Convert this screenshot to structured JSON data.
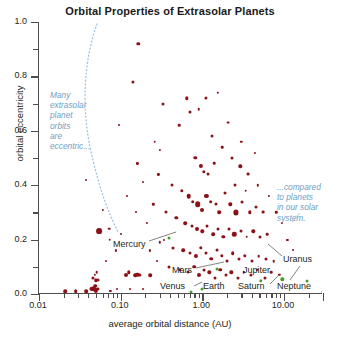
{
  "chart_data": {
    "type": "scatter",
    "title": "Orbital Properties of Extrasolar Planets",
    "xlabel": "average orbital distance (AU)",
    "ylabel": "orbital eccentricity",
    "xscale": "log",
    "xlim": [
      0.01,
      30.0
    ],
    "ylim": [
      0.0,
      1.0
    ],
    "grid": false,
    "legend": "none",
    "xticklabels": [
      "0.01",
      "0.10",
      "1.00",
      "10.00"
    ],
    "xtickvalues": [
      0.01,
      0.1,
      1.0,
      10.0
    ],
    "yticklabels": [
      "0.0",
      "0.2",
      "0.4",
      "0.6",
      "0.8",
      "1.0"
    ],
    "ytickvalues": [
      0.0,
      0.2,
      0.4,
      0.6,
      0.8,
      1.0
    ],
    "series": [
      {
        "name": "extrasolar planets",
        "color": "#8c1117",
        "points": [
          [
            0.021,
            0.01,
            3.6
          ],
          [
            0.028,
            0.01,
            3.6
          ],
          [
            0.038,
            0.01,
            3.6
          ],
          [
            0.043,
            0.02,
            3.0
          ],
          [
            0.045,
            0.02,
            4.6
          ],
          [
            0.047,
            0.02,
            5.4
          ],
          [
            0.049,
            0.03,
            3.6
          ],
          [
            0.05,
            0.01,
            4.2
          ],
          [
            0.052,
            0.02,
            3.2
          ],
          [
            0.046,
            0.06,
            3.2
          ],
          [
            0.048,
            0.07,
            2.4
          ],
          [
            0.05,
            0.05,
            3.4
          ],
          [
            0.053,
            0.05,
            3.0
          ],
          [
            0.051,
            0.08,
            2.6
          ],
          [
            0.075,
            0.01,
            2.2
          ],
          [
            0.09,
            0.02,
            2.0
          ],
          [
            0.115,
            0.07,
            4.0
          ],
          [
            0.125,
            0.08,
            3.4
          ],
          [
            0.15,
            0.07,
            3.6
          ],
          [
            0.16,
            0.07,
            4.4
          ],
          [
            0.172,
            0.07,
            3.2
          ],
          [
            0.23,
            0.07,
            3.6
          ],
          [
            0.13,
            0.02,
            2.0
          ],
          [
            0.19,
            0.02,
            2.0
          ],
          [
            0.055,
            0.23,
            5.8
          ],
          [
            0.072,
            0.24,
            2.6
          ],
          [
            0.073,
            0.2,
            2.6
          ],
          [
            0.06,
            0.31,
            2.2
          ],
          [
            0.038,
            0.42,
            2.0
          ],
          [
            0.165,
            0.92,
            3.4
          ],
          [
            0.14,
            0.78,
            3.2
          ],
          [
            0.095,
            0.62,
            2.0
          ],
          [
            0.26,
            0.56,
            2.6
          ],
          [
            0.3,
            0.53,
            2.2
          ],
          [
            0.33,
            0.7,
            3.0
          ],
          [
            0.52,
            0.62,
            2.6
          ],
          [
            0.64,
            0.72,
            3.4
          ],
          [
            0.7,
            0.67,
            3.0
          ],
          [
            0.9,
            0.68,
            2.6
          ],
          [
            1.1,
            0.72,
            3.2
          ],
          [
            1.55,
            0.74,
            2.4
          ],
          [
            2.05,
            0.63,
            2.8
          ],
          [
            1.3,
            0.58,
            3.0
          ],
          [
            1.75,
            0.54,
            2.6
          ],
          [
            0.82,
            0.5,
            3.4
          ],
          [
            0.96,
            0.47,
            4.2
          ],
          [
            1.05,
            0.45,
            3.4
          ],
          [
            1.18,
            0.44,
            3.0
          ],
          [
            1.4,
            0.48,
            2.6
          ],
          [
            2.3,
            0.5,
            3.0
          ],
          [
            2.9,
            0.47,
            3.4
          ],
          [
            3.6,
            0.44,
            2.8
          ],
          [
            0.42,
            0.4,
            3.0
          ],
          [
            0.56,
            0.38,
            3.4
          ],
          [
            0.68,
            0.36,
            4.6
          ],
          [
            0.76,
            0.34,
            3.6
          ],
          [
            0.88,
            0.33,
            5.6
          ],
          [
            0.99,
            0.31,
            4.0
          ],
          [
            1.12,
            0.36,
            4.2
          ],
          [
            1.26,
            0.34,
            3.6
          ],
          [
            1.45,
            0.33,
            3.0
          ],
          [
            1.6,
            0.3,
            3.6
          ],
          [
            1.9,
            0.37,
            3.0
          ],
          [
            2.2,
            0.33,
            3.4
          ],
          [
            2.6,
            0.3,
            5.2
          ],
          [
            3.1,
            0.34,
            3.0
          ],
          [
            3.8,
            0.3,
            3.4
          ],
          [
            4.6,
            0.32,
            3.0
          ],
          [
            5.6,
            0.3,
            2.8
          ],
          [
            0.36,
            0.3,
            3.0
          ],
          [
            0.48,
            0.28,
            3.4
          ],
          [
            0.62,
            0.26,
            3.6
          ],
          [
            0.74,
            0.25,
            3.0
          ],
          [
            0.86,
            0.24,
            4.0
          ],
          [
            1.0,
            0.23,
            3.4
          ],
          [
            1.15,
            0.25,
            3.0
          ],
          [
            1.35,
            0.22,
            3.6
          ],
          [
            1.55,
            0.24,
            3.0
          ],
          [
            1.8,
            0.21,
            3.4
          ],
          [
            2.1,
            0.24,
            3.0
          ],
          [
            2.45,
            0.22,
            4.4
          ],
          [
            2.95,
            0.23,
            3.0
          ],
          [
            3.5,
            0.21,
            2.6
          ],
          [
            4.2,
            0.23,
            3.4
          ],
          [
            5.1,
            0.21,
            3.0
          ],
          [
            6.2,
            0.22,
            2.6
          ],
          [
            0.3,
            0.19,
            2.4
          ],
          [
            0.44,
            0.17,
            3.0
          ],
          [
            0.58,
            0.16,
            3.6
          ],
          [
            0.7,
            0.15,
            3.0
          ],
          [
            0.83,
            0.14,
            4.2
          ],
          [
            0.95,
            0.17,
            3.4
          ],
          [
            1.1,
            0.15,
            3.0
          ],
          [
            1.28,
            0.13,
            3.6
          ],
          [
            1.5,
            0.16,
            3.0
          ],
          [
            1.72,
            0.14,
            3.4
          ],
          [
            2.0,
            0.12,
            3.0
          ],
          [
            2.35,
            0.15,
            3.6
          ],
          [
            2.8,
            0.13,
            3.0
          ],
          [
            3.3,
            0.14,
            3.4
          ],
          [
            4.0,
            0.12,
            3.0
          ],
          [
            4.9,
            0.14,
            2.6
          ],
          [
            6.0,
            0.13,
            3.0
          ],
          [
            7.5,
            0.12,
            2.6
          ],
          [
            0.39,
            0.1,
            3.0
          ],
          [
            0.53,
            0.09,
            3.4
          ],
          [
            0.66,
            0.08,
            3.0
          ],
          [
            0.79,
            0.1,
            3.6
          ],
          [
            0.92,
            0.07,
            4.0
          ],
          [
            1.06,
            0.09,
            3.0
          ],
          [
            1.22,
            0.08,
            3.4
          ],
          [
            1.42,
            0.06,
            3.0
          ],
          [
            1.65,
            0.09,
            3.6
          ],
          [
            1.95,
            0.07,
            3.0
          ],
          [
            2.25,
            0.08,
            3.4
          ],
          [
            2.7,
            0.06,
            3.0
          ],
          [
            3.2,
            0.08,
            2.6
          ],
          [
            3.9,
            0.07,
            3.0
          ],
          [
            4.7,
            0.09,
            2.6
          ],
          [
            5.8,
            0.06,
            3.0
          ],
          [
            7.0,
            0.08,
            2.6
          ],
          [
            8.8,
            0.07,
            2.4
          ],
          [
            0.29,
            0.44,
            2.2
          ],
          [
            0.25,
            0.33,
            2.4
          ],
          [
            0.21,
            0.26,
            2.2
          ],
          [
            0.19,
            0.41,
            2.0
          ],
          [
            0.155,
            0.3,
            2.0
          ],
          [
            0.34,
            0.2,
            2.2
          ],
          [
            0.28,
            0.12,
            2.0
          ],
          [
            0.23,
            0.16,
            2.2
          ],
          [
            3.0,
            0.56,
            2.4
          ],
          [
            4.4,
            0.52,
            2.2
          ],
          [
            2.5,
            0.4,
            3.0
          ],
          [
            3.4,
            0.38,
            2.6
          ],
          [
            4.8,
            0.4,
            2.4
          ],
          [
            6.5,
            0.36,
            2.2
          ],
          [
            8.0,
            0.3,
            2.4
          ],
          [
            9.5,
            0.26,
            2.2
          ],
          [
            11.0,
            0.2,
            2.2
          ],
          [
            13.0,
            0.16,
            2.0
          ],
          [
            0.16,
            0.48,
            2.2
          ],
          [
            0.12,
            0.36,
            2.0
          ],
          [
            0.1,
            0.22,
            2.0
          ],
          [
            0.088,
            0.16,
            2.2
          ],
          [
            0.066,
            0.12,
            2.0
          ]
        ]
      },
      {
        "name": "solar system planets",
        "color": "#4f9b2f",
        "points": [
          [
            0.387,
            0.206,
            3.0
          ],
          [
            0.723,
            0.007,
            3.0
          ],
          [
            1.0,
            0.017,
            3.0
          ],
          [
            1.524,
            0.093,
            3.0
          ],
          [
            5.203,
            0.048,
            3.4
          ],
          [
            9.537,
            0.054,
            3.4
          ],
          [
            19.19,
            0.047,
            3.0
          ],
          [
            30.07,
            0.009,
            3.0
          ]
        ]
      }
    ],
    "annotations": [
      {
        "name": "eccentric-note",
        "text": "Many extrasolar planet orbits are eccentric...",
        "color": "#6f9ec4",
        "position": "left"
      },
      {
        "name": "solar-system-note",
        "text": "...compared to planets in our solar system.",
        "color": "#6f9ec4",
        "position": "right"
      }
    ],
    "planet_labels": [
      "Mercury",
      "Mars",
      "Venus",
      "Earth",
      "Jupiter",
      "Saturn",
      "Uranus",
      "Neptune"
    ]
  },
  "annotation_lines": {
    "left": [
      "Many",
      "extrasolar",
      "planet",
      "orbits",
      "are",
      "eccentric..."
    ],
    "right": [
      "...compared",
      "to planets",
      "in our solar",
      "system."
    ]
  },
  "planet_callouts": {
    "mercury": "Mercury",
    "mars": "Mars",
    "venus": "Venus",
    "earth": "Earth",
    "jupiter": "Jupiter",
    "saturn": "Saturn",
    "uranus": "Uranus",
    "neptune": "Neptune"
  }
}
